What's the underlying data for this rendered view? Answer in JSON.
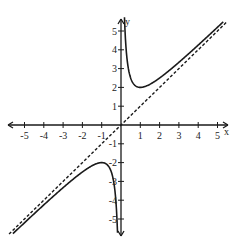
{
  "chart_data": {
    "type": "line",
    "title": "",
    "xlabel": "x",
    "ylabel": "y",
    "xlim": [
      -5.7,
      5.7
    ],
    "ylim": [
      -5.8,
      5.8
    ],
    "grid": false,
    "legend": null,
    "x_ticks": [
      -5,
      -4,
      -3,
      -2,
      -1,
      1,
      2,
      3,
      4,
      5
    ],
    "x_tick_labels": [
      "-5",
      "-4",
      "-3",
      "-2",
      "-1",
      "1",
      "2",
      "3",
      "4",
      "5"
    ],
    "y_ticks": [
      5,
      4,
      3,
      2,
      1,
      -1,
      -2,
      -3,
      -4,
      -5
    ],
    "y_tick_labels": [
      "5",
      "4",
      "3",
      "2",
      "1",
      "-1",
      "-2",
      "-3",
      "-4",
      "-5"
    ],
    "series": [
      {
        "name": "curve",
        "style": "solid",
        "function": "y = x + 1/x",
        "key_points": [
          {
            "x": 0.18,
            "y": 5.74
          },
          {
            "x": 0.5,
            "y": 2.5
          },
          {
            "x": 1,
            "y": 2
          },
          {
            "x": 2,
            "y": 2.5
          },
          {
            "x": 3,
            "y": 3.33
          },
          {
            "x": 4,
            "y": 4.25
          },
          {
            "x": 5.3,
            "y": 5.49
          },
          {
            "x": -0.18,
            "y": -5.74
          },
          {
            "x": -0.5,
            "y": -2.5
          },
          {
            "x": -1,
            "y": -2
          },
          {
            "x": -2,
            "y": -2.5
          },
          {
            "x": -3,
            "y": -3.33
          },
          {
            "x": -4,
            "y": -4.25
          },
          {
            "x": -5.6,
            "y": -5.78
          }
        ]
      },
      {
        "name": "asymptote",
        "style": "dashed",
        "function": "y = x",
        "key_points": [
          {
            "x": -5.8,
            "y": -5.8
          },
          {
            "x": 5.5,
            "y": 5.5
          }
        ]
      }
    ],
    "annotations": []
  },
  "labels": {
    "x_axis": "x",
    "y_axis": "y"
  }
}
